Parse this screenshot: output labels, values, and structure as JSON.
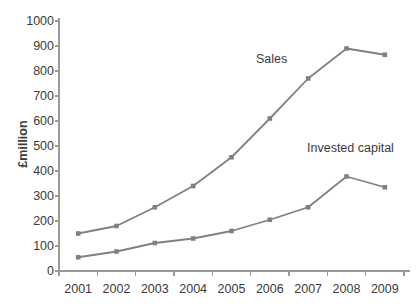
{
  "chart_data": {
    "type": "line",
    "title": "",
    "subtitle": "",
    "xlabel": "",
    "ylabel": "£million",
    "categories": [
      "2001",
      "2002",
      "2003",
      "2004",
      "2005",
      "2006",
      "2007",
      "2008",
      "2009"
    ],
    "series": [
      {
        "name": "Sales",
        "values": [
          150,
          180,
          255,
          340,
          455,
          610,
          770,
          890,
          865
        ],
        "color": "#808080",
        "marker": "square"
      },
      {
        "name": "Invested capital",
        "values": [
          55,
          78,
          112,
          130,
          160,
          205,
          255,
          378,
          335
        ],
        "color": "#808080",
        "marker": "square"
      }
    ],
    "ylim": [
      0,
      1000
    ],
    "ytick_values": [
      0,
      100,
      200,
      300,
      400,
      500,
      600,
      700,
      800,
      900,
      1000
    ],
    "ytick_labels": [
      "0",
      "100",
      "200",
      "300",
      "400",
      "500",
      "600",
      "700",
      "800",
      "900",
      "1000"
    ],
    "grid": false,
    "legend": "inline-annotations",
    "legend_position": "inline",
    "annotations": [
      {
        "text": "Sales",
        "series": "Sales"
      },
      {
        "text": "Invested capital",
        "series": "Invested capital"
      }
    ],
    "axis_color": "#9a9a9a",
    "background": "#ffffff"
  }
}
